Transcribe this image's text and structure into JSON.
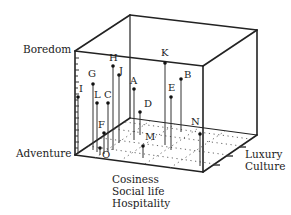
{
  "diagram": {
    "type": "3d-scatter-box",
    "axes": {
      "vertical": {
        "top_label": "Boredom",
        "bottom_label": "Adventure"
      },
      "depth_front": {
        "labels": [
          "Cosiness",
          "Social life",
          "Hospitality"
        ]
      },
      "depth_right": {
        "labels": [
          "Luxury",
          "Culture"
        ]
      }
    },
    "points": [
      {
        "id": "K",
        "label": "K"
      },
      {
        "id": "B",
        "label": "B"
      },
      {
        "id": "E",
        "label": "E"
      },
      {
        "id": "D",
        "label": "D"
      },
      {
        "id": "A",
        "label": "A"
      },
      {
        "id": "H",
        "label": "H"
      },
      {
        "id": "J",
        "label": "J"
      },
      {
        "id": "G",
        "label": "G"
      },
      {
        "id": "I",
        "label": "I"
      },
      {
        "id": "L",
        "label": "L"
      },
      {
        "id": "C",
        "label": "C"
      },
      {
        "id": "F",
        "label": "F"
      },
      {
        "id": "O",
        "label": "O"
      },
      {
        "id": "M",
        "label": "M"
      },
      {
        "id": "N",
        "label": "N"
      }
    ]
  }
}
